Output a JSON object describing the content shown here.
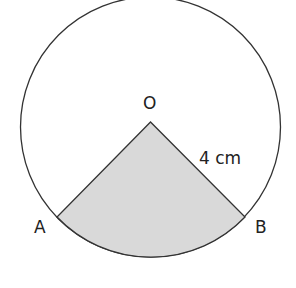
{
  "diagram": {
    "type": "circle-sector",
    "labels": {
      "center": "O",
      "point_a": "A",
      "point_b": "B",
      "radius": "4 cm"
    },
    "radius_cm": 4,
    "sector_angle_deg": 90,
    "colors": {
      "outline": "#333333",
      "shading": "#d9d9d9",
      "background": "#ffffff"
    }
  }
}
